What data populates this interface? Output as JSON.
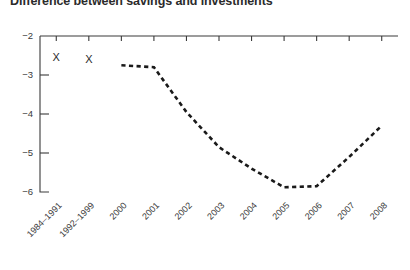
{
  "chart_data": {
    "type": "line",
    "title": "Difference between savings and investments",
    "xlabel": "",
    "ylabel": "",
    "categories": [
      "1984–1991",
      "1992–1999",
      "2000",
      "2001",
      "2002",
      "2003",
      "2004",
      "2005",
      "2006",
      "2007",
      "2008"
    ],
    "ylim": [
      -6,
      -2
    ],
    "y_ticks": [
      -2,
      -3,
      -4,
      -5,
      -6
    ],
    "y_tick_labels": [
      "−2",
      "−3",
      "−4",
      "−5",
      "−6"
    ],
    "grid": false,
    "legend": "none",
    "axis_style": "top-axis-with-downward-ticks",
    "series": [
      {
        "name": "Difference between savings and investments",
        "style": "dashed-line",
        "values": [
          null,
          null,
          -2.75,
          -2.8,
          -3.95,
          -4.85,
          -5.4,
          -5.88,
          -5.85,
          -5.1,
          -4.3
        ]
      },
      {
        "name": "Period averages",
        "style": "x-marker",
        "marker_glyph": "X",
        "values": [
          -2.55,
          -2.6,
          null,
          null,
          null,
          null,
          null,
          null,
          null,
          null,
          null
        ]
      }
    ],
    "colors": {
      "line": "#1a1a1a",
      "axis": "#3a3a3a",
      "text": "#2b2b2b",
      "background": "#ffffff"
    }
  }
}
